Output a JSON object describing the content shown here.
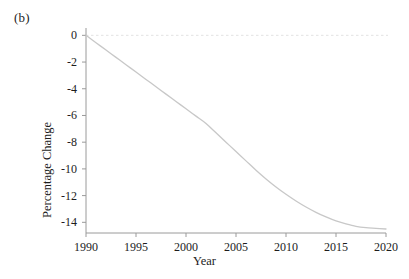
{
  "panel": {
    "label": "(b)"
  },
  "chart_data": {
    "type": "line",
    "title": "",
    "subtitle": "",
    "panel_label": "(b)",
    "xlabel": "Year",
    "ylabel": "Percentage Change",
    "xlim": [
      1990,
      2020
    ],
    "ylim": [
      -14.8,
      0.4
    ],
    "grid": false,
    "legend": null,
    "legend_position": "none",
    "xticks": [
      1990,
      1995,
      2000,
      2005,
      2010,
      2015,
      2020
    ],
    "xtick_labels": [
      "1990",
      "1995",
      "2000",
      "2005",
      "2010",
      "2015",
      "2020"
    ],
    "yticks": [
      0,
      -2,
      -4,
      -6,
      -8,
      -10,
      -12,
      -14
    ],
    "ytick_labels": [
      "0",
      "-2",
      "-4",
      "-6",
      "-8",
      "-10",
      "-12",
      "-14"
    ],
    "line_color": "#c8c8c8",
    "axis_color": "#9a9a9a",
    "series": [
      {
        "name": "Percentage Change",
        "x": [
          1990,
          1991,
          1992,
          1993,
          1994,
          1995,
          1996,
          1997,
          1998,
          1999,
          2000,
          2001,
          2002,
          2003,
          2004,
          2005,
          2006,
          2007,
          2008,
          2009,
          2010,
          2011,
          2012,
          2013,
          2014,
          2015,
          2016,
          2017,
          2018,
          2019,
          2020
        ],
        "values": [
          0.0,
          -0.55,
          -1.1,
          -1.65,
          -2.2,
          -2.75,
          -3.3,
          -3.85,
          -4.4,
          -4.95,
          -5.5,
          -6.05,
          -6.6,
          -7.3,
          -8.0,
          -8.7,
          -9.4,
          -10.1,
          -10.75,
          -11.35,
          -11.9,
          -12.4,
          -12.85,
          -13.25,
          -13.6,
          -13.9,
          -14.12,
          -14.3,
          -14.4,
          -14.45,
          -14.5
        ]
      }
    ],
    "reference_line": {
      "name": "zero-line",
      "y": 0,
      "style": "dashed",
      "color": "#e2e2e2"
    }
  }
}
